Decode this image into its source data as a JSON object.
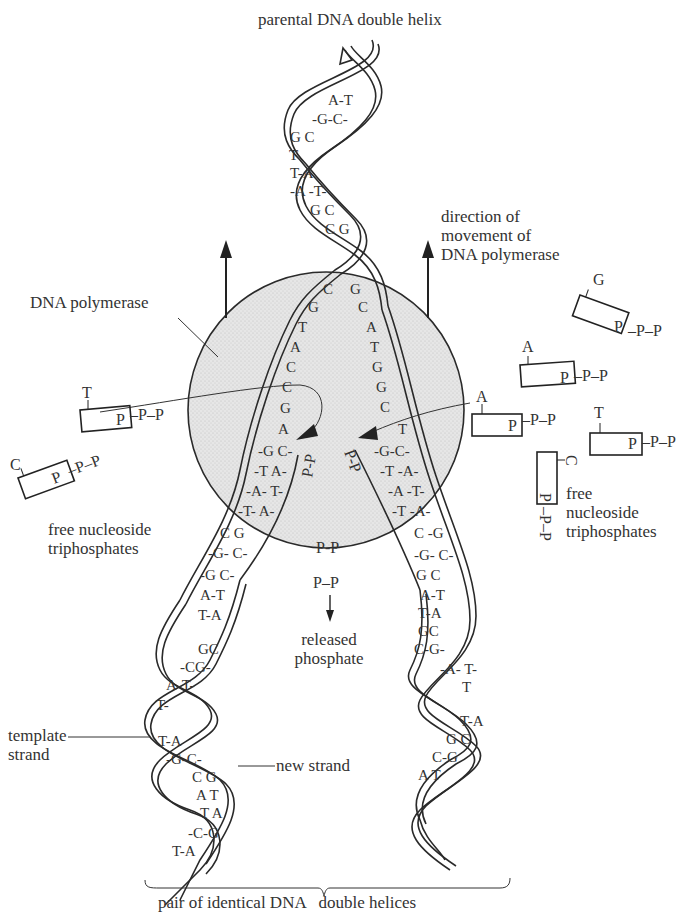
{
  "title": "parental DNA double helix",
  "labels": {
    "direction": [
      "direction of",
      "movement of",
      "DNA polymerase"
    ],
    "polymerase": "DNA polymerase",
    "free_left": [
      "free nucleoside",
      "triphosphates"
    ],
    "free_right": [
      "free",
      "nucleoside",
      "triphosphates"
    ],
    "released": [
      "released",
      "phosphate"
    ],
    "template": [
      "template",
      "strand"
    ],
    "new_strand": "new strand",
    "bottom": "pair of identical DNA   double helices"
  },
  "phosphate": {
    "p": "P",
    "pp": "P–P",
    "ppp_tail": "–P–P",
    "released_pp_inside": "P-P",
    "released_pp_outside": "P–P"
  },
  "free_nucleotides": [
    {
      "base": "G",
      "side": "right",
      "position": "top"
    },
    {
      "base": "A",
      "side": "right",
      "position": "upper"
    },
    {
      "base": "A",
      "side": "right",
      "position": "entering"
    },
    {
      "base": "T",
      "side": "right",
      "position": "middle"
    },
    {
      "base": "C",
      "side": "right",
      "position": "vertical"
    },
    {
      "base": "T",
      "side": "left",
      "position": "entering"
    },
    {
      "base": "C",
      "side": "left",
      "position": "lower"
    }
  ],
  "parental_pairs": [
    "A-T",
    "G-C",
    "G C",
    "T",
    "T-A",
    "A-T",
    "G C",
    "C G"
  ],
  "fork_left_template": [
    "C",
    "G",
    "T",
    "A",
    "C",
    "C",
    "G",
    "A"
  ],
  "fork_right_template": [
    "G",
    "C",
    "A",
    "T",
    "G",
    "G",
    "C",
    "T"
  ],
  "left_daughter_pairs": [
    "G C",
    "T A",
    "A T",
    "T A",
    "C G",
    "G C",
    "G C",
    "A T",
    "T A",
    "G C",
    "C G",
    "A T",
    "T",
    "T A",
    "G C",
    "C G",
    "A T",
    "T A",
    "C G",
    "T A"
  ],
  "right_daughter_pairs": [
    "G C",
    "T A",
    "A T",
    "T A",
    "C G",
    "G C",
    "G C",
    "A T",
    "T A",
    "G C",
    "C G",
    "A T",
    "T",
    "T A",
    "G C",
    "C G",
    "A T"
  ]
}
